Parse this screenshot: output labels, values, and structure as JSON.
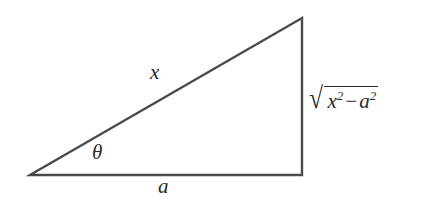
{
  "figure": {
    "type": "right-triangle-trigonometric-substitution",
    "background_color": "#ffffff",
    "stroke_color": "#4a4a4a",
    "text_color": "#2b2b2b"
  },
  "geometry": {
    "vertices": {
      "left": {
        "x": 30,
        "y": 175
      },
      "apex": {
        "x": 302,
        "y": 18
      },
      "bottom_right": {
        "x": 302,
        "y": 175
      }
    },
    "sides": {
      "hypotenuse": "x",
      "base": "a",
      "vertical": "sqrt(x^2 - a^2)"
    }
  },
  "labels": {
    "hypotenuse": "x",
    "angle": "θ",
    "base": "a",
    "radical": {
      "sign": "√",
      "base_var": "x",
      "base_exponent": "2",
      "operator": "−",
      "second_var": "a",
      "second_exponent": "2"
    }
  }
}
